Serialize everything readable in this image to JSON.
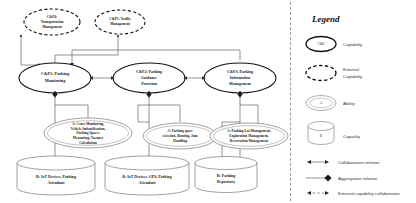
{
  "diagram": {
    "external_capabilities": [
      {
        "id": "cp4",
        "label_line1": "C&P4:",
        "label_line2": "Transportation",
        "label_line3": "Management"
      },
      {
        "id": "cp5",
        "label_line1": "C&P5: Traffic",
        "label_line2": "Management",
        "label_line3": ""
      }
    ],
    "capabilities": [
      {
        "id": "cp1",
        "label_line1": "C&P1: Parking",
        "label_line2": "Monitoring",
        "label_line3": ""
      },
      {
        "id": "cp2",
        "label_line1": "C&P2: Parking",
        "label_line2": "Guidance",
        "label_line3": "Provision"
      },
      {
        "id": "cp3",
        "label_line1": "C&P3: Parking",
        "label_line2": "Information",
        "label_line3": "Management"
      }
    ],
    "abilities": [
      {
        "id": "ab1",
        "line1": "A: Cross Monitoring,",
        "line2": "Vehicle Indentification,",
        "line3": "Parking Spaces",
        "line4": "Measuring, Vacancy",
        "line5": "Calculation"
      },
      {
        "id": "ab2",
        "line1": "A: Parking space",
        "line2": "selection, Routing, Jam",
        "line3": "Handling",
        "line4": "",
        "line5": ""
      },
      {
        "id": "ab3",
        "line1": "A: Parking Lot Management,",
        "line2": "Exploration Management,",
        "line3": "Reservation Management",
        "line4": "",
        "line5": ""
      }
    ],
    "resources": [
      {
        "id": "res1",
        "line1": "R: IoT Devices, Parking",
        "line2": "Attendant"
      },
      {
        "id": "res2",
        "line1": "R: IoT Devices, GPS, Parking",
        "line2": "Attendant"
      },
      {
        "id": "res3",
        "line1": "R: Parking",
        "line2": "Repository"
      }
    ]
  },
  "legend": {
    "title": "Legend",
    "shape_items": [
      {
        "id": "capability",
        "label": "Capability",
        "glyph": "C&P",
        "glyph_kind": "solid-ellipse"
      },
      {
        "id": "external-capability",
        "label_line1": "External",
        "label_line2": "Capability",
        "glyph": "",
        "glyph_kind": "dashed-ellipse"
      },
      {
        "id": "ability",
        "label": "Ability",
        "glyph": "A",
        "glyph_kind": "thin-ellipse"
      },
      {
        "id": "resource",
        "label": "Capaility",
        "glyph": "R",
        "glyph_kind": "cylinder"
      }
    ],
    "relation_items": [
      {
        "id": "collaboration-relation",
        "label": "Collaboration relation",
        "glyph_kind": "arrow-line-arrow"
      },
      {
        "id": "aggregation-relation",
        "label": "Aggregation relation",
        "glyph_kind": "line-diamond"
      },
      {
        "id": "external-capability-collaboration",
        "label": "External capability collaboration",
        "glyph_kind": "arrow-dashed-arrow"
      }
    ]
  },
  "colors": {
    "stroke_dark": "#111111",
    "stroke_mid": "#555555",
    "connector": "#4a4a4a",
    "background": "#ffffff"
  }
}
